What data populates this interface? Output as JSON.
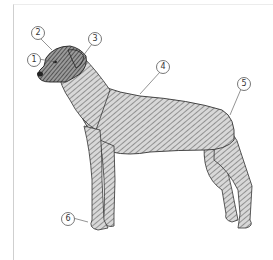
{
  "figure": {
    "callouts": [
      {
        "label": "1",
        "x": 27,
        "y": 53,
        "tx": 55,
        "ty": 62
      },
      {
        "label": "2",
        "x": 31,
        "y": 26,
        "tx": 52,
        "ty": 50
      },
      {
        "label": "3",
        "x": 88,
        "y": 32,
        "tx": 83,
        "ty": 56
      },
      {
        "label": "4",
        "x": 156,
        "y": 60,
        "tx": 140,
        "ty": 94
      },
      {
        "label": "5",
        "x": 237,
        "y": 77,
        "tx": 230,
        "ty": 115
      },
      {
        "label": "6",
        "x": 61,
        "y": 212,
        "tx": 88,
        "ty": 222
      }
    ]
  },
  "colors": {
    "ink": "#2b2b2b",
    "shade": "#8a8a8a",
    "frame": "#cfcfcf"
  }
}
